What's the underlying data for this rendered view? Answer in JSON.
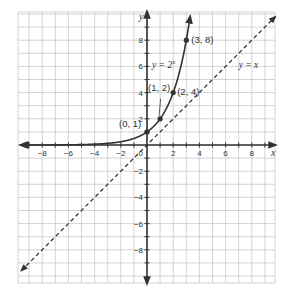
{
  "chart_data": {
    "type": "line",
    "title": "",
    "xlabel": "x",
    "ylabel": "y",
    "xlim": [
      -10,
      10
    ],
    "ylim": [
      -10.5,
      10
    ],
    "grid": true,
    "grid_step": 1,
    "x_ticks": [
      -8,
      -6,
      -4,
      -2,
      2,
      4,
      6,
      8
    ],
    "y_ticks": [
      8,
      6,
      4,
      2,
      -2,
      -4,
      -6,
      -8
    ],
    "origin_label": "0",
    "series": [
      {
        "name": "y = 2^x",
        "label": "y = 2",
        "label_exp": "x",
        "style": "solid",
        "color": "#333333",
        "function": "2^x",
        "points": [
          {
            "x": 0,
            "y": 1,
            "label": "(0, 1)"
          },
          {
            "x": 1,
            "y": 2,
            "label": "(1, 2)"
          },
          {
            "x": 2,
            "y": 4,
            "label": "(2, 4)"
          },
          {
            "x": 3,
            "y": 8,
            "label": "(3, 8)"
          }
        ]
      },
      {
        "name": "y = x",
        "label": "y = x",
        "style": "dashed",
        "color": "#333333",
        "function": "x"
      }
    ],
    "colors": {
      "grid": "#c8c8c8",
      "axis": "#333333",
      "curve": "#333333"
    }
  }
}
